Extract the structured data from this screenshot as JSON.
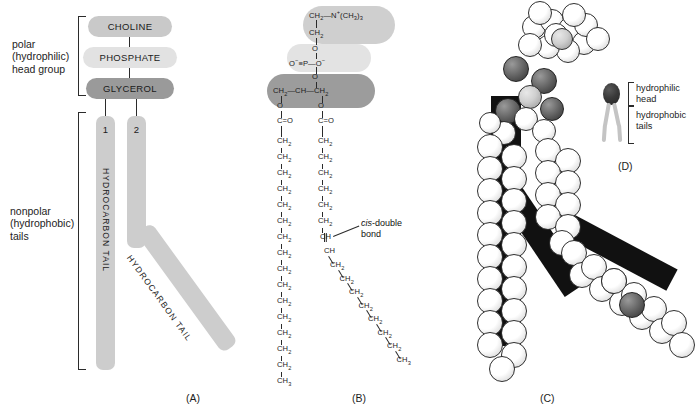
{
  "figure": {
    "panels": [
      {
        "id": "A",
        "label": "(A)"
      },
      {
        "id": "B",
        "label": "(B)"
      },
      {
        "id": "C",
        "label": "(C)"
      },
      {
        "id": "D",
        "label": "(D)"
      }
    ]
  },
  "panelA": {
    "bracket_labels": {
      "head": "polar\n(hydrophilic)\nhead group",
      "head_line1": "polar",
      "head_line2": "(hydrophilic)",
      "head_line3": "head group",
      "tails_line1": "nonpolar",
      "tails_line2": "(hydrophobic)",
      "tails_line3": "tails"
    },
    "capsules": [
      {
        "name": "choline",
        "label": "CHOLINE",
        "color": "#c9c9c9"
      },
      {
        "name": "phosphate",
        "label": "PHOSPHATE",
        "color": "#e2e2e2"
      },
      {
        "name": "glycerol",
        "label": "GLYCEROL",
        "color": "#9a9a9a"
      }
    ],
    "tails": [
      {
        "number": "1",
        "label": "HYDROCARBON TAIL",
        "shape": "straight"
      },
      {
        "number": "2",
        "label": "HYDROCARBON TAIL",
        "shape": "kinked"
      }
    ],
    "tail_color": "#cdcdcd",
    "panel_label": "(A)"
  },
  "panelB": {
    "panel_label": "(B)",
    "annotation": {
      "italic": "cis",
      "rest": "-double",
      "line2": "bond"
    },
    "choline": {
      "top": "CH₂—N⁺(CH₃)₃",
      "second": "CH₂",
      "group_color": "#cfcfcf"
    },
    "phosphate": {
      "o_top": "O",
      "line": "O⁻—P—O⁻",
      "o_bottom": "O",
      "group_color": "#e3e3e3"
    },
    "glycerol": {
      "backbone": "CH₂—CH—CH₂",
      "group_color": "#9c9c9c"
    },
    "ester": {
      "o": "O",
      "carbonyl": "C=O"
    },
    "chain1": {
      "repeat": "CH₂",
      "repeat_count": 15,
      "terminal": "CH₃",
      "saturated": true
    },
    "chain2": {
      "repeat": "CH₂",
      "double_bond_atoms": [
        "CH",
        "CH"
      ],
      "terminal": "CH₃",
      "saturated": false
    }
  },
  "panelC": {
    "panel_label": "(C)",
    "model": "space-filling",
    "atom_colors": {
      "hydrogen_carbon": "#ffffff",
      "oxygen": "#4a4a4a",
      "phosphorus": "#cfcfcf"
    }
  },
  "panelD": {
    "panel_label": "(D)",
    "labels": {
      "head_line1": "hydrophilic",
      "head_line2": "head",
      "tails_line1": "hydrophobic",
      "tails_line2": "tails"
    },
    "head_color": "#2b2b2b",
    "tail_color": "#c4c4c4"
  }
}
